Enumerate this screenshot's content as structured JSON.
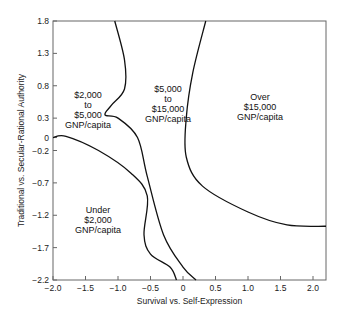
{
  "chart_data": {
    "type": "line",
    "title": "",
    "xlabel": "Survival vs. Self-Expression",
    "ylabel": "Traditional vs. Secular-Rational Authority",
    "xlim": [
      -2.0,
      2.2
    ],
    "ylim": [
      -2.2,
      1.8
    ],
    "x_ticks": [
      "-2.0",
      "-1.5",
      "-1.0",
      "-0.5",
      "0",
      "0.5",
      "1.0",
      "1.5",
      "2.0"
    ],
    "y_ticks": [
      "1.8",
      "1.3",
      "0.8",
      "0.3",
      "0",
      "-0.2",
      "-0.7",
      "-1.2",
      "-1.7",
      "-2.2"
    ],
    "grid": false,
    "regions": [
      {
        "name": "under-2000",
        "lines": [
          "Under",
          "$2,000",
          "GNP/capita"
        ]
      },
      {
        "name": "2000-5000",
        "lines": [
          "$2,000",
          "to",
          "$5,000",
          "GNP/capita"
        ]
      },
      {
        "name": "5000-15000",
        "lines": [
          "$5,000",
          "to",
          "$15,000",
          "GNP/capita"
        ]
      },
      {
        "name": "over-15000",
        "lines": [
          "Over",
          "$15,000",
          "GNP/capita"
        ]
      }
    ],
    "boundaries": [
      {
        "name": "under-2000-boundary",
        "points": [
          [
            -2.0,
            0.0
          ],
          [
            -1.8,
            0.02
          ],
          [
            -1.3,
            -0.2
          ],
          [
            -0.8,
            -0.55
          ],
          [
            -0.55,
            -0.9
          ],
          [
            -0.6,
            -1.5
          ],
          [
            -0.5,
            -1.8
          ],
          [
            -0.2,
            -2.0
          ],
          [
            -0.1,
            -2.2
          ]
        ]
      },
      {
        "name": "2000-5000-boundary",
        "points": [
          [
            -1.05,
            1.8
          ],
          [
            -0.9,
            1.2
          ],
          [
            -0.9,
            0.75
          ],
          [
            -1.1,
            0.5
          ],
          [
            -1.2,
            0.35
          ],
          [
            -1.0,
            0.3
          ],
          [
            -0.7,
            0.0
          ],
          [
            -0.55,
            -0.6
          ],
          [
            -0.3,
            -1.5
          ],
          [
            0.0,
            -2.0
          ],
          [
            0.2,
            -2.2
          ]
        ]
      },
      {
        "name": "over-15000-boundary",
        "points": [
          [
            0.35,
            1.8
          ],
          [
            0.15,
            1.0
          ],
          [
            0.05,
            0.3
          ],
          [
            0.05,
            -0.3
          ],
          [
            0.3,
            -0.75
          ],
          [
            1.0,
            -1.15
          ],
          [
            1.6,
            -1.35
          ],
          [
            2.2,
            -1.37
          ]
        ]
      }
    ]
  }
}
